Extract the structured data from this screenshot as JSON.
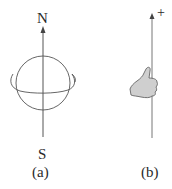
{
  "panel_a": {
    "north_label": "N",
    "south_label": "S",
    "caption": "(a)",
    "icons": [
      "spinning-sphere-icon",
      "axis-arrow-icon"
    ]
  },
  "panel_b": {
    "plus_label": "+",
    "caption": "(b)",
    "icons": [
      "right-hand-thumb-icon",
      "axis-arrow-icon"
    ]
  },
  "colors": {
    "line": "#555555",
    "hand_fill": "#cfcfcf",
    "text": "#2a2a2a"
  }
}
